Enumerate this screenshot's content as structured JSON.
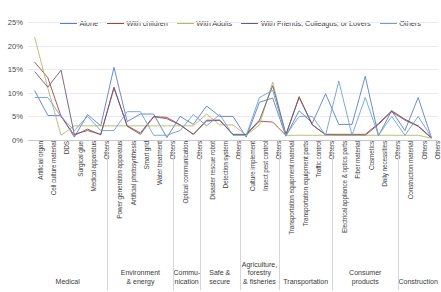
{
  "chart_data": {
    "type": "line",
    "title": "",
    "xlabel": "",
    "ylabel": "",
    "ylim": [
      0,
      25
    ],
    "ytick_labels": [
      "0%",
      "5%",
      "10%",
      "15%",
      "20%",
      "25%"
    ],
    "ytick_values": [
      0,
      5,
      10,
      15,
      20,
      25
    ],
    "grid": true,
    "legend_position": "top",
    "categories": [
      "Artificial organ",
      "Cell culture material",
      "DDS",
      "Surgical glue",
      "Medical apparatus",
      "Others",
      "Power generation apparatus",
      "Artificial photosynthesis",
      "Smart grid",
      "Water treatment",
      "Others",
      "Optical communication",
      "Others",
      "Disaster rescue robot",
      "Detection system",
      "Others",
      "Culture implement",
      "Insect pest control",
      "Others",
      "Transportation equipment material",
      "Transportation equipment parts",
      "Traffic control",
      "Others",
      "Electrical appliance & optics parts",
      "Fiber material",
      "Cosmetics",
      "Daily necessities",
      "Others",
      "Construction material",
      "Others",
      "Others"
    ],
    "series": [
      {
        "name": "Alone",
        "color": "#5b7fc4",
        "values": [
          10.5,
          5.2,
          5.2,
          0.6,
          5.4,
          3.0,
          15.4,
          3.9,
          5.5,
          5.5,
          0.5,
          5.0,
          3.3,
          7.2,
          5.0,
          5.0,
          0.6,
          8.0,
          8.9,
          0.8,
          6.2,
          3.6,
          9.8,
          3.3,
          3.3,
          13.5,
          0.9,
          6.2,
          2.0,
          9.0,
          0.5
        ]
      },
      {
        "name": "With children",
        "color": "#a5453c",
        "values": [
          16.5,
          13.2,
          5.0,
          1.0,
          2.3,
          1.1,
          11.2,
          2.9,
          1.2,
          4.9,
          4.8,
          3.2,
          1.2,
          4.0,
          4.2,
          1.1,
          1.1,
          4.0,
          3.8,
          1.0,
          9.2,
          3.2,
          1.1,
          1.0,
          1.0,
          1.0,
          3.3,
          6.0,
          4.2,
          2.9,
          0.4
        ]
      },
      {
        "name": "With Adults",
        "color": "#b3b96a",
        "values": [
          21.8,
          11.0,
          1.0,
          3.0,
          3.0,
          3.0,
          3.0,
          3.0,
          3.0,
          3.0,
          3.0,
          3.0,
          3.0,
          5.5,
          3.2,
          3.2,
          1.0,
          3.2,
          12.3,
          1.0,
          1.0,
          1.0,
          1.0,
          1.0,
          1.0,
          1.0,
          1.0,
          1.0,
          1.0,
          1.0,
          0.4
        ]
      },
      {
        "name": "With Friends, Colleagus, or Lovers",
        "color": "#6d5a74",
        "values": [
          14.5,
          11.2,
          14.8,
          1.2,
          2.0,
          1.2,
          11.0,
          3.0,
          1.5,
          5.0,
          4.5,
          3.2,
          1.2,
          4.2,
          4.2,
          1.2,
          1.2,
          4.2,
          11.5,
          1.2,
          9.0,
          3.2,
          1.2,
          1.2,
          1.2,
          1.2,
          3.5,
          6.2,
          4.4,
          3.0,
          0.5
        ]
      },
      {
        "name": "Others",
        "color": "#6f9fd8",
        "values": [
          9.0,
          9.0,
          5.0,
          2.0,
          5.0,
          2.0,
          2.0,
          6.0,
          6.0,
          1.0,
          1.0,
          2.0,
          5.4,
          3.0,
          5.4,
          1.0,
          1.0,
          9.0,
          10.5,
          1.0,
          5.0,
          5.0,
          1.0,
          12.5,
          1.0,
          9.0,
          1.0,
          5.0,
          1.0,
          5.0,
          0.6
        ]
      }
    ],
    "groups": [
      {
        "label": "Medical",
        "start": 0,
        "end": 5
      },
      {
        "label": "Environment\n& energy",
        "start": 6,
        "end": 10
      },
      {
        "label": "Commu-\nnication",
        "start": 11,
        "end": 12
      },
      {
        "label": "Safe &\nsecure",
        "start": 13,
        "end": 15
      },
      {
        "label": "Agriculture,\nforestry\n& fisheries",
        "start": 16,
        "end": 18
      },
      {
        "label": "Transportation",
        "start": 19,
        "end": 22
      },
      {
        "label": "Consumer\nproducts",
        "start": 23,
        "end": 27
      },
      {
        "label": "Construction",
        "start": 28,
        "end": 30
      }
    ]
  }
}
